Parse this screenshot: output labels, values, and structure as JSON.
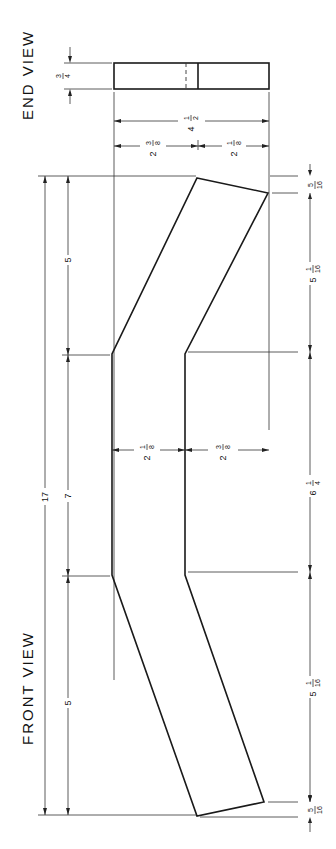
{
  "views": {
    "end_view": {
      "title": "END VIEW"
    },
    "front_view": {
      "title": "FRONT VIEW"
    }
  },
  "dimensions": {
    "end_thickness": {
      "whole": "",
      "num": "3",
      "den": "4"
    },
    "end_total_width": {
      "whole": "4",
      "num": "1",
      "den": "2"
    },
    "end_left_part": {
      "whole": "2",
      "num": "3",
      "den": "8"
    },
    "end_right_part": {
      "whole": "2",
      "num": "1",
      "den": "8"
    },
    "overall_length": {
      "whole": "17"
    },
    "segment_top": {
      "whole": "5"
    },
    "segment_middle": {
      "whole": "7"
    },
    "segment_bottom": {
      "whole": "5"
    },
    "mid_left_width": {
      "whole": "2",
      "num": "1",
      "den": "8"
    },
    "mid_right_width": {
      "whole": "2",
      "num": "3",
      "den": "8"
    },
    "right_top_offset": {
      "whole": "",
      "num": "5",
      "den": "16"
    },
    "right_top_segment": {
      "whole": "5",
      "num": "1",
      "den": "16"
    },
    "right_middle_segment": {
      "whole": "6",
      "num": "1",
      "den": "4"
    },
    "right_bottom_segment": {
      "whole": "5",
      "num": "1",
      "den": "16"
    },
    "right_bottom_offset": {
      "whole": "",
      "num": "5",
      "den": "16"
    }
  }
}
